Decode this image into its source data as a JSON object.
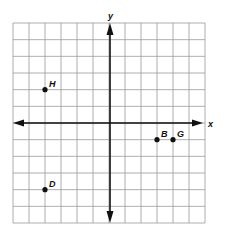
{
  "diagram": {
    "type": "coordinate-plane",
    "grid": {
      "cells_x": 12,
      "cells_y": 12,
      "x_range": [
        -6,
        6
      ],
      "y_range": [
        -6,
        6
      ],
      "line_color": "#9a9a9a",
      "border_color": "#8a8a8a"
    },
    "axes": {
      "x_label": "x",
      "y_label": "y",
      "color": "#111111"
    },
    "points": [
      {
        "label": "H",
        "x": -4,
        "y": 2
      },
      {
        "label": "D",
        "x": -4,
        "y": -4
      },
      {
        "label": "B",
        "x": 3,
        "y": -1
      },
      {
        "label": "G",
        "x": 4,
        "y": -1
      }
    ]
  }
}
